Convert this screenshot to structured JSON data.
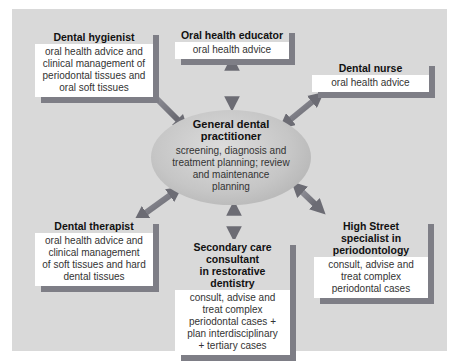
{
  "diagram": {
    "center": {
      "title": "General dental practitioner",
      "title_lines": [
        "General dental",
        "practitioner"
      ],
      "description": "screening, diagnosis and treatment planning; review and maintenance planning",
      "description_lines": [
        "screening, diagnosis and",
        "treatment planning; review",
        "and maintenance",
        "planning"
      ]
    },
    "nodes": [
      {
        "id": "dental-hygienist",
        "title": "Dental hygienist",
        "description": "oral health advice and clinical management of periodontal tissues and oral soft tissues",
        "description_lines": [
          "oral health advice and",
          "clinical management of",
          "periodontal tissues and",
          "oral soft tissues"
        ]
      },
      {
        "id": "oral-health-educator",
        "title": "Oral health educator",
        "description": "oral health advice"
      },
      {
        "id": "dental-nurse",
        "title": "Dental nurse",
        "description": "oral health advice"
      },
      {
        "id": "dental-therapist",
        "title": "Dental therapist",
        "description": "oral health advice and clinical management of soft tissues and hard dental tissues",
        "description_lines": [
          "oral health advice and",
          "clinical management",
          "of soft tissues and hard",
          "dental tissues"
        ]
      },
      {
        "id": "secondary-care-consultant",
        "title": "Secondary care consultant in restorative dentistry",
        "title_lines": [
          "Secondary care",
          "consultant",
          "in restorative dentistry"
        ],
        "description": "consult, advise and treat complex periodontal cases + plan interdisciplinary + tertiary cases",
        "description_lines": [
          "consult, advise and",
          "treat complex",
          "periodontal cases +",
          "plan interdisciplinary",
          "+ tertiary cases"
        ]
      },
      {
        "id": "high-street-specialist",
        "title": "High Street specialist in periodontology",
        "title_lines": [
          "High Street",
          "specialist in",
          "periodontology"
        ],
        "description": "consult, advise and treat complex periodontal cases",
        "description_lines": [
          "consult, advise and",
          "treat complex",
          "periodontal cases"
        ]
      }
    ],
    "edges": [
      {
        "from": "General dental practitioner",
        "to": "Dental hygienist",
        "direction": "bidirectional"
      },
      {
        "from": "General dental practitioner",
        "to": "Oral health educator",
        "direction": "bidirectional"
      },
      {
        "from": "General dental practitioner",
        "to": "Dental nurse",
        "direction": "bidirectional"
      },
      {
        "from": "General dental practitioner",
        "to": "Dental therapist",
        "direction": "bidirectional"
      },
      {
        "from": "General dental practitioner",
        "to": "Secondary care consultant in restorative dentistry",
        "direction": "bidirectional"
      },
      {
        "from": "General dental practitioner",
        "to": "High Street specialist in periodontology",
        "direction": "bidirectional"
      }
    ],
    "colors": {
      "panel": "#d9d9d9",
      "card_body": "#ffffff",
      "card_shadow": "#7e7e86",
      "arrow": "#7a7a84",
      "ellipse": "#c6c6c6"
    }
  }
}
